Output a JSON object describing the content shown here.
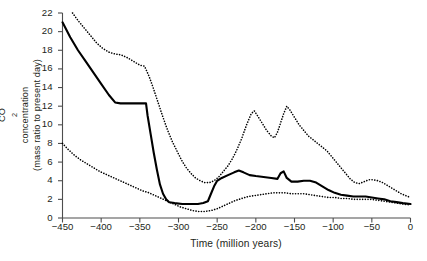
{
  "figure": {
    "background": "#ffffff",
    "line_color": "#000000",
    "axis_color": "#4d4d4d"
  },
  "axis": {
    "y_title_line1": "CO",
    "y_title_sub": "2",
    "y_title_line1b": " concentration",
    "y_title_line2": "(mass ratio to present day)",
    "x_title": "Time (million years)",
    "y_ticks": [
      "0",
      "2",
      "4",
      "6",
      "8",
      "10",
      "12",
      "14",
      "16",
      "18",
      "20",
      "22"
    ],
    "x_ticks": [
      "-450",
      "-400",
      "-350",
      "-300",
      "-250",
      "-200",
      "-150",
      "-100",
      "-50",
      "0"
    ]
  },
  "chart_data": {
    "type": "line",
    "title": "",
    "xlabel": "Time (million years)",
    "ylabel": "CO2 concentration (mass ratio to present day)",
    "xlim": [
      -450,
      0
    ],
    "ylim": [
      0,
      22
    ],
    "xtick_values": [
      -450,
      -400,
      -350,
      -300,
      -250,
      -200,
      -150,
      -100,
      -50,
      0
    ],
    "ytick_values": [
      0,
      2,
      4,
      6,
      8,
      10,
      12,
      14,
      16,
      18,
      20,
      22
    ],
    "grid": false,
    "legend": "none",
    "series": [
      {
        "name": "best estimate",
        "style": "solid",
        "points": [
          [
            -450,
            21.0
          ],
          [
            -440,
            19.4
          ],
          [
            -430,
            18.0
          ],
          [
            -420,
            16.8
          ],
          [
            -410,
            15.6
          ],
          [
            -400,
            14.4
          ],
          [
            -390,
            13.2
          ],
          [
            -382,
            12.4
          ],
          [
            -375,
            12.3
          ],
          [
            -360,
            12.3
          ],
          [
            -350,
            12.3
          ],
          [
            -342,
            12.3
          ],
          [
            -340,
            11.0
          ],
          [
            -336,
            9.0
          ],
          [
            -332,
            7.0
          ],
          [
            -328,
            5.2
          ],
          [
            -324,
            3.6
          ],
          [
            -320,
            2.6
          ],
          [
            -316,
            2.0
          ],
          [
            -312,
            1.7
          ],
          [
            -305,
            1.6
          ],
          [
            -295,
            1.5
          ],
          [
            -285,
            1.5
          ],
          [
            -275,
            1.5
          ],
          [
            -268,
            1.6
          ],
          [
            -262,
            1.8
          ],
          [
            -258,
            2.6
          ],
          [
            -254,
            3.4
          ],
          [
            -250,
            4.0
          ],
          [
            -244,
            4.3
          ],
          [
            -236,
            4.6
          ],
          [
            -228,
            4.9
          ],
          [
            -222,
            5.1
          ],
          [
            -216,
            4.9
          ],
          [
            -208,
            4.6
          ],
          [
            -200,
            4.5
          ],
          [
            -190,
            4.4
          ],
          [
            -180,
            4.3
          ],
          [
            -172,
            4.2
          ],
          [
            -168,
            4.8
          ],
          [
            -164,
            5.0
          ],
          [
            -160,
            4.3
          ],
          [
            -154,
            3.9
          ],
          [
            -146,
            3.9
          ],
          [
            -138,
            4.0
          ],
          [
            -130,
            4.0
          ],
          [
            -122,
            3.8
          ],
          [
            -114,
            3.4
          ],
          [
            -106,
            3.0
          ],
          [
            -98,
            2.7
          ],
          [
            -90,
            2.5
          ],
          [
            -82,
            2.4
          ],
          [
            -74,
            2.3
          ],
          [
            -66,
            2.3
          ],
          [
            -58,
            2.3
          ],
          [
            -50,
            2.2
          ],
          [
            -42,
            2.1
          ],
          [
            -34,
            2.0
          ],
          [
            -26,
            1.8
          ],
          [
            -18,
            1.7
          ],
          [
            -10,
            1.6
          ],
          [
            0,
            1.5
          ]
        ]
      },
      {
        "name": "upper bound",
        "style": "dotted",
        "points": [
          [
            -437,
            22.0
          ],
          [
            -430,
            21.2
          ],
          [
            -422,
            20.4
          ],
          [
            -414,
            19.6
          ],
          [
            -406,
            18.8
          ],
          [
            -398,
            18.2
          ],
          [
            -390,
            17.8
          ],
          [
            -382,
            17.6
          ],
          [
            -374,
            17.5
          ],
          [
            -366,
            17.2
          ],
          [
            -358,
            16.8
          ],
          [
            -350,
            16.4
          ],
          [
            -344,
            16.3
          ],
          [
            -338,
            15.2
          ],
          [
            -332,
            13.8
          ],
          [
            -326,
            12.3
          ],
          [
            -320,
            10.8
          ],
          [
            -314,
            9.4
          ],
          [
            -308,
            8.2
          ],
          [
            -302,
            7.2
          ],
          [
            -296,
            6.2
          ],
          [
            -290,
            5.4
          ],
          [
            -284,
            4.8
          ],
          [
            -278,
            4.3
          ],
          [
            -272,
            4.0
          ],
          [
            -266,
            3.8
          ],
          [
            -260,
            3.8
          ],
          [
            -254,
            4.0
          ],
          [
            -248,
            4.4
          ],
          [
            -242,
            5.0
          ],
          [
            -236,
            5.6
          ],
          [
            -230,
            6.4
          ],
          [
            -224,
            7.4
          ],
          [
            -218,
            8.6
          ],
          [
            -212,
            10.0
          ],
          [
            -206,
            11.2
          ],
          [
            -202,
            11.5
          ],
          [
            -198,
            11.0
          ],
          [
            -192,
            10.2
          ],
          [
            -186,
            9.4
          ],
          [
            -180,
            8.8
          ],
          [
            -176,
            8.6
          ],
          [
            -172,
            9.2
          ],
          [
            -168,
            10.2
          ],
          [
            -164,
            11.2
          ],
          [
            -160,
            12.0
          ],
          [
            -156,
            11.6
          ],
          [
            -150,
            10.8
          ],
          [
            -144,
            10.0
          ],
          [
            -138,
            9.4
          ],
          [
            -132,
            8.8
          ],
          [
            -126,
            8.4
          ],
          [
            -120,
            8.0
          ],
          [
            -114,
            7.6
          ],
          [
            -108,
            7.2
          ],
          [
            -102,
            6.6
          ],
          [
            -96,
            6.0
          ],
          [
            -90,
            5.4
          ],
          [
            -84,
            4.8
          ],
          [
            -78,
            4.2
          ],
          [
            -72,
            3.8
          ],
          [
            -66,
            3.7
          ],
          [
            -60,
            3.9
          ],
          [
            -54,
            4.1
          ],
          [
            -48,
            4.1
          ],
          [
            -42,
            4.0
          ],
          [
            -36,
            3.8
          ],
          [
            -30,
            3.5
          ],
          [
            -24,
            3.2
          ],
          [
            -18,
            2.9
          ],
          [
            -12,
            2.6
          ],
          [
            -6,
            2.4
          ],
          [
            0,
            2.2
          ]
        ]
      },
      {
        "name": "lower bound",
        "style": "dotted",
        "points": [
          [
            -450,
            8.0
          ],
          [
            -442,
            7.3
          ],
          [
            -434,
            6.7
          ],
          [
            -426,
            6.2
          ],
          [
            -418,
            5.8
          ],
          [
            -410,
            5.4
          ],
          [
            -402,
            5.0
          ],
          [
            -394,
            4.7
          ],
          [
            -386,
            4.4
          ],
          [
            -378,
            4.1
          ],
          [
            -370,
            3.8
          ],
          [
            -362,
            3.5
          ],
          [
            -354,
            3.2
          ],
          [
            -346,
            2.9
          ],
          [
            -338,
            2.7
          ],
          [
            -330,
            2.4
          ],
          [
            -322,
            2.1
          ],
          [
            -314,
            1.8
          ],
          [
            -306,
            1.5
          ],
          [
            -298,
            1.2
          ],
          [
            -290,
            1.0
          ],
          [
            -282,
            0.8
          ],
          [
            -274,
            0.7
          ],
          [
            -266,
            0.7
          ],
          [
            -258,
            0.8
          ],
          [
            -250,
            1.0
          ],
          [
            -242,
            1.3
          ],
          [
            -234,
            1.6
          ],
          [
            -226,
            1.9
          ],
          [
            -218,
            2.1
          ],
          [
            -210,
            2.3
          ],
          [
            -202,
            2.4
          ],
          [
            -194,
            2.5
          ],
          [
            -186,
            2.6
          ],
          [
            -178,
            2.7
          ],
          [
            -170,
            2.7
          ],
          [
            -162,
            2.7
          ],
          [
            -154,
            2.6
          ],
          [
            -146,
            2.6
          ],
          [
            -138,
            2.6
          ],
          [
            -130,
            2.5
          ],
          [
            -122,
            2.4
          ],
          [
            -114,
            2.3
          ],
          [
            -106,
            2.2
          ],
          [
            -98,
            2.2
          ],
          [
            -90,
            2.1
          ],
          [
            -82,
            2.1
          ],
          [
            -74,
            2.0
          ],
          [
            -66,
            2.0
          ],
          [
            -58,
            2.0
          ],
          [
            -50,
            2.0
          ],
          [
            -42,
            1.9
          ],
          [
            -34,
            1.8
          ],
          [
            -26,
            1.7
          ],
          [
            -18,
            1.6
          ],
          [
            -10,
            1.5
          ],
          [
            0,
            1.4
          ]
        ]
      }
    ]
  }
}
